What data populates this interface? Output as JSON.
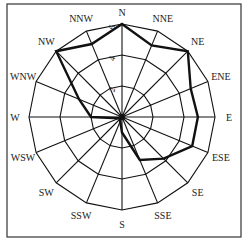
{
  "chart_data": {
    "type": "radar",
    "title": "",
    "categories": [
      "N",
      "NNE",
      "NE",
      "ENE",
      "E",
      "ESE",
      "SE",
      "SSE",
      "S",
      "SSW",
      "SW",
      "WSW",
      "W",
      "WNW",
      "NW",
      "NNW"
    ],
    "series": [
      {
        "name": "frequency",
        "values": [
          6,
          5,
          6,
          4.8,
          4.9,
          4.9,
          3.8,
          3,
          1,
          0.3,
          0.2,
          0.2,
          2,
          3,
          6,
          5.1
        ]
      }
    ],
    "radial_ticks": [
      2,
      4,
      6
    ],
    "rlim": [
      0,
      6
    ],
    "grid": true,
    "legend": "none",
    "colors": {
      "line": "#111111",
      "grid": "#111111",
      "frame": "#333333"
    }
  }
}
